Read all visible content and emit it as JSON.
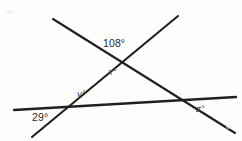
{
  "figure": {
    "background_color": "#fdfdfc",
    "stroke_color": "#231f20",
    "label_color": "#2b2b2b",
    "variable_label_color": "#4a4a4a",
    "width": 242,
    "height": 141,
    "lines": [
      {
        "name": "transversal-descending",
        "x1": 53,
        "y1": 19,
        "x2": 235,
        "y2": 133,
        "stroke_width": 2.1
      },
      {
        "name": "transversal-ascending",
        "x1": 32,
        "y1": 137,
        "x2": 178,
        "y2": 16,
        "stroke_width": 2.1
      },
      {
        "name": "base-horizontal",
        "x1": 14,
        "y1": 110,
        "x2": 236,
        "y2": 97,
        "stroke_width": 2.3
      }
    ],
    "intersections": [
      {
        "name": "apex",
        "x": 118,
        "y": 60
      },
      {
        "name": "left-base",
        "x": 67,
        "y": 107
      },
      {
        "name": "right-base",
        "x": 180,
        "y": 99
      }
    ],
    "labels": [
      {
        "id": "angle-108",
        "text": "108°",
        "kind": "numeric",
        "x": 103,
        "y": 38
      },
      {
        "id": "angle-x",
        "text": "x°",
        "kind": "variable",
        "x": 108,
        "y": 67
      },
      {
        "id": "angle-y",
        "text": "y°",
        "kind": "variable",
        "x": 77,
        "y": 89
      },
      {
        "id": "angle-29",
        "text": "29°",
        "kind": "numeric",
        "x": 32,
        "y": 112
      },
      {
        "id": "angle-z",
        "text": "z°",
        "kind": "variable",
        "x": 196,
        "y": 104
      }
    ]
  }
}
